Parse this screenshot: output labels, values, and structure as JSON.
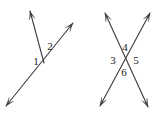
{
  "diagram": {
    "canvas": {
      "width": 160,
      "height": 117
    },
    "stroke_color": "#3a3a40",
    "label_color": "#1a1a1a",
    "background_color": "#ffffff",
    "stroke_width": 1.1,
    "figures": [
      {
        "id": "left-figure",
        "name": "angle-pair-figure",
        "description": "A ray and a line meeting at a common vertex forming angles 1 and 2",
        "vertex": {
          "x": 44,
          "y": 63
        },
        "segments": [
          {
            "name": "ray-upper-left",
            "from": {
              "x": 44,
              "y": 63
            },
            "to": {
              "x": 30,
              "y": 11
            },
            "arrow_at_to": true,
            "arrow_at_from": false
          },
          {
            "name": "line-lower-left-to-upper-right",
            "from": {
              "x": 6,
              "y": 106
            },
            "to": {
              "x": 73,
              "y": 23
            },
            "arrow_at_to": true,
            "arrow_at_from": true
          }
        ],
        "labels": [
          {
            "name": "angle-label-1",
            "text": "1",
            "x": 36,
            "y": 62
          },
          {
            "name": "angle-label-2",
            "text": "2",
            "x": 50,
            "y": 47
          }
        ]
      },
      {
        "id": "right-figure",
        "name": "vertical-angles-figure",
        "description": "Two lines crossing forming four angles 3, 4, 5 and 6",
        "vertex": {
          "x": 124,
          "y": 60
        },
        "segments": [
          {
            "name": "line-upper-left-to-lower-right",
            "from": {
              "x": 105,
              "y": 13
            },
            "to": {
              "x": 148,
              "y": 107
            },
            "arrow_at_to": true,
            "arrow_at_from": true
          },
          {
            "name": "line-upper-right-to-lower-left",
            "from": {
              "x": 150,
              "y": 13
            },
            "to": {
              "x": 100,
              "y": 106
            },
            "arrow_at_to": true,
            "arrow_at_from": true
          }
        ],
        "labels": [
          {
            "name": "angle-label-4",
            "text": "4",
            "x": 125,
            "y": 48
          },
          {
            "name": "angle-label-3",
            "text": "3",
            "x": 113,
            "y": 61
          },
          {
            "name": "angle-label-5",
            "text": "5",
            "x": 136,
            "y": 61
          },
          {
            "name": "angle-label-6",
            "text": "6",
            "x": 124,
            "y": 73
          }
        ]
      }
    ]
  }
}
